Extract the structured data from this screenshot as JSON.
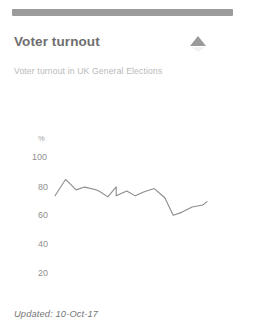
{
  "card": {
    "title": "Voter turnout",
    "subtitle": "Voter turnout in UK General Elections",
    "collapse_icon": "triangle-up-icon",
    "updated_label": "Updated: 10-Oct-17"
  },
  "colors": {
    "top_bar": "#9b9b9b",
    "title_text": "#6e6e6e",
    "subtitle_text": "#b9b9b9",
    "tick_text": "#8f8f8f",
    "line": "#8c8c8c",
    "card_background": "#ffffff",
    "icon": "#9a9a9a"
  },
  "chart_data": {
    "type": "line",
    "title": "Voter turnout",
    "subtitle": "Voter turnout in UK General Elections",
    "xlabel": "",
    "ylabel": "%",
    "unit": "%",
    "grid": false,
    "legend": false,
    "xlim": [
      1945,
      2017
    ],
    "ylim": [
      0,
      100
    ],
    "yticks": [
      100,
      80,
      60,
      40,
      20,
      0
    ],
    "ytick_labels": [
      "100",
      "80",
      "60",
      "40",
      "20",
      "0"
    ],
    "xticks": [
      1945,
      2017
    ],
    "xtick_labels": [
      "1945",
      "2017"
    ],
    "series": [
      {
        "name": "Voter turnout",
        "x": [
          1945,
          1950,
          1951,
          1955,
          1959,
          1964,
          1966,
          1970,
          1974,
          1974,
          1979,
          1983,
          1987,
          1992,
          1997,
          2001,
          2005,
          2010,
          2015,
          2017
        ],
        "values": [
          72.8,
          83.9,
          82.6,
          76.8,
          78.7,
          77.1,
          75.8,
          72.0,
          78.8,
          72.8,
          76.0,
          72.7,
          75.3,
          77.7,
          71.4,
          59.4,
          61.4,
          65.1,
          66.4,
          68.8
        ]
      }
    ]
  }
}
